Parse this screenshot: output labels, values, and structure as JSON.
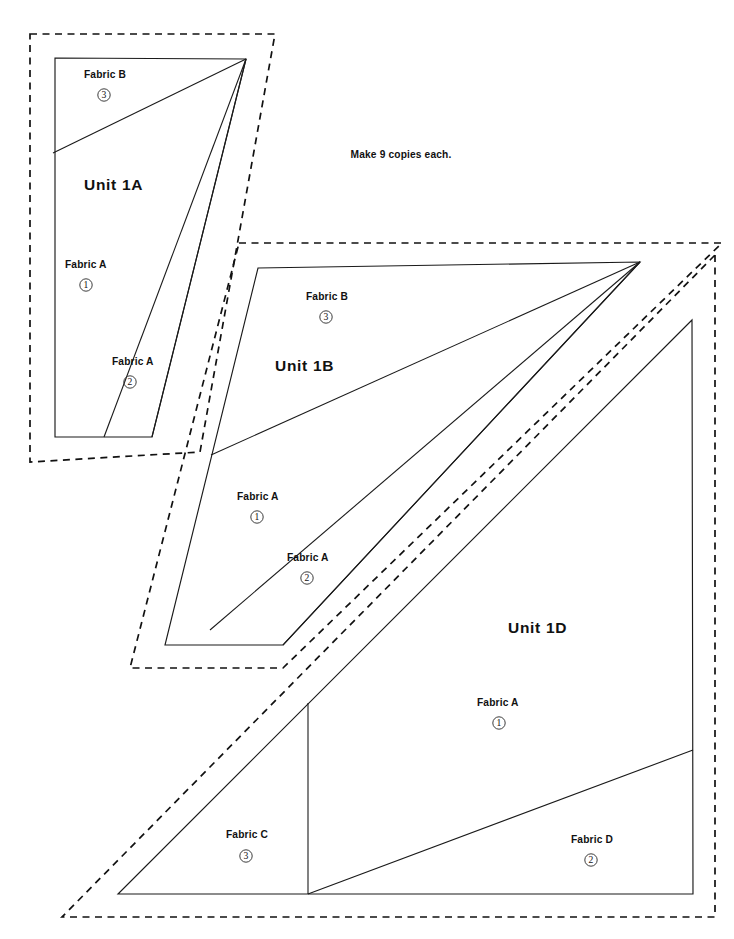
{
  "document": {
    "kind": "quilt-foundation-paper-piecing-pattern",
    "note": "Make 9 copies each."
  },
  "units": [
    {
      "id": "1A",
      "title": "Unit 1A",
      "title_pos": {
        "x": 84,
        "y": 190
      },
      "patches": [
        {
          "fabric_label": "Fabric B",
          "number": "3",
          "label_pos": {
            "x": 84,
            "y": 78
          },
          "circle_pos": {
            "x": 104,
            "y": 95
          }
        },
        {
          "fabric_label": "Fabric A",
          "number": "1",
          "label_pos": {
            "x": 65,
            "y": 268
          },
          "circle_pos": {
            "x": 86,
            "y": 285
          }
        },
        {
          "fabric_label": "Fabric A",
          "number": "2",
          "label_pos": {
            "x": 112,
            "y": 365
          },
          "circle_pos": {
            "x": 130,
            "y": 382
          }
        }
      ]
    },
    {
      "id": "1B",
      "title": "Unit 1B",
      "title_pos": {
        "x": 275,
        "y": 371
      },
      "patches": [
        {
          "fabric_label": "Fabric B",
          "number": "3",
          "label_pos": {
            "x": 306,
            "y": 300
          },
          "circle_pos": {
            "x": 326,
            "y": 317
          }
        },
        {
          "fabric_label": "Fabric A",
          "number": "1",
          "label_pos": {
            "x": 237,
            "y": 500
          },
          "circle_pos": {
            "x": 257,
            "y": 517
          }
        },
        {
          "fabric_label": "Fabric A",
          "number": "2",
          "label_pos": {
            "x": 287,
            "y": 561
          },
          "circle_pos": {
            "x": 307,
            "y": 578
          }
        }
      ]
    },
    {
      "id": "1D",
      "title": "Unit 1D",
      "title_pos": {
        "x": 508,
        "y": 633
      },
      "patches": [
        {
          "fabric_label": "Fabric A",
          "number": "1",
          "label_pos": {
            "x": 477,
            "y": 706
          },
          "circle_pos": {
            "x": 499,
            "y": 723
          }
        },
        {
          "fabric_label": "Fabric C",
          "number": "3",
          "label_pos": {
            "x": 226,
            "y": 838
          },
          "circle_pos": {
            "x": 246,
            "y": 856
          }
        },
        {
          "fabric_label": "Fabric D",
          "number": "2",
          "label_pos": {
            "x": 571,
            "y": 843
          },
          "circle_pos": {
            "x": 591,
            "y": 860
          }
        }
      ]
    }
  ],
  "note_pos": {
    "x": 401,
    "y": 158
  },
  "geometry": {
    "unit_1a": {
      "cut_dashed": "M 30,34 L 275,34 L 200,452 L 30,462 Z",
      "sew_solid": "M 55,58 L 246,59 L 152,437 L 55,437 Z",
      "seam_b_a": "M 53,153 L 246,59",
      "seam_a1_a2": "M 104,437 L 246,59",
      "seam_a2_edge": "M 152,437 L 246,59"
    },
    "unit_1b": {
      "cut_dashed": "M 239,243 L 722,243 L 283,668 L 130,668 Z",
      "sew_solid": "M 258,268 L 640,262 L 283,645 L 165,645 Z",
      "seam_b_a": "M 211,455 L 640,262",
      "seam_a1_a2": "M 210,630 L 640,262",
      "seam_a2_edge": "M 283,645 L 640,262"
    },
    "unit_1d": {
      "cut_dashed": "M 715,255 L 715,917 L 62,917 Z",
      "sew_solid": "M 692,320 L 693,894 L 118,894 Z",
      "seam_vertical": "M 308,703 L 308,894",
      "seam_c_d": "M 308,894 L 693,750"
    }
  },
  "colors": {
    "line": "#1a1a1a",
    "dashed": "#111111",
    "text": "#111111",
    "background": "#ffffff",
    "circle_stroke": "#333333"
  }
}
